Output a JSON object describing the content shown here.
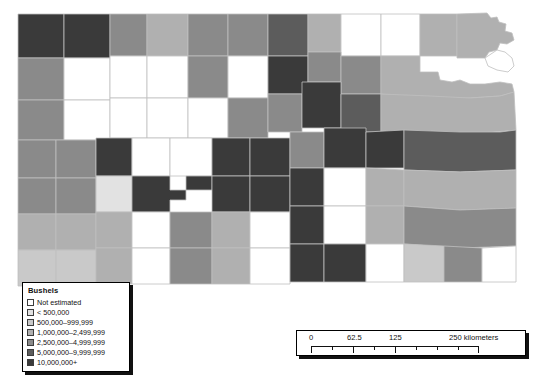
{
  "map": {
    "title": "Kansas county choropleth map",
    "region": "Kansas",
    "background_color": "#ffffff",
    "border_color": "#bfbfbf",
    "classes": [
      {
        "key": "not_estimated",
        "label": "Not estimated",
        "color": "#ffffff"
      },
      {
        "key": "lt500k",
        "label": "< 500,000",
        "color": "#e2e2e2"
      },
      {
        "key": "500k_999k",
        "label": "500,000–999,999",
        "color": "#c9c9c9"
      },
      {
        "key": "1m_2499k",
        "label": "1,000,000–2,499,999",
        "color": "#b0b0b0"
      },
      {
        "key": "2500k_4999k",
        "label": "2,500,000–4,999,999",
        "color": "#8a8a8a"
      },
      {
        "key": "5m_9999k",
        "label": "5,000,000–9,999,999",
        "color": "#5c5c5c"
      },
      {
        "key": "10m_plus",
        "label": "10,000,000+",
        "color": "#3a3a3a"
      }
    ],
    "counties": [
      {
        "name": "cheyenne",
        "class": 6,
        "d": "M18,14 L64,14 L64,58 L18,58 Z"
      },
      {
        "name": "rawlins",
        "class": 6,
        "d": "M64,14 L110,14 L110,58 L64,58 Z"
      },
      {
        "name": "decatur",
        "class": 4,
        "d": "M110,14 L147,14 L147,56 L110,56 Z"
      },
      {
        "name": "norton",
        "class": 3,
        "d": "M147,14 L188,14 L188,56 L147,56 Z"
      },
      {
        "name": "phillips",
        "class": 4,
        "d": "M188,14 L228,14 L228,56 L188,56 Z"
      },
      {
        "name": "smith",
        "class": 4,
        "d": "M228,14 L268,14 L268,56 L228,56 Z"
      },
      {
        "name": "jewell",
        "class": 5,
        "d": "M268,14 L308,14 L308,56 L268,56 Z"
      },
      {
        "name": "republic",
        "class": 3,
        "d": "M308,14 L341,14 L341,52 L308,52 Z"
      },
      {
        "name": "washington",
        "class": 0,
        "d": "M341,14 L381,14 L381,56 L341,56 Z"
      },
      {
        "name": "marshall",
        "class": 0,
        "d": "M381,14 L420,14 L420,56 L381,56 Z"
      },
      {
        "name": "nemaha",
        "class": 3,
        "d": "M420,14 L457,14 L457,56 L420,56 Z"
      },
      {
        "name": "brown",
        "class": 3,
        "d": "M457,14 L487,13 L491,18 L497,17 L499,22 L506,24 L505,31 L512,33 L514,40 L507,44 L500,43 L497,50 L489,52 L485,58 L457,58 Z"
      },
      {
        "name": "sherman",
        "class": 4,
        "d": "M18,58 L64,58 L64,100 L18,100 Z"
      },
      {
        "name": "thomas",
        "class": 0,
        "d": "M64,58 L110,58 L110,100 L64,100 Z"
      },
      {
        "name": "sheridan",
        "class": 0,
        "d": "M110,56 L147,56 L147,98 L110,98 Z"
      },
      {
        "name": "graham",
        "class": 0,
        "d": "M147,56 L188,56 L188,98 L147,98 Z"
      },
      {
        "name": "rooks",
        "class": 4,
        "d": "M188,56 L228,56 L228,98 L188,98 Z"
      },
      {
        "name": "osborne",
        "class": 0,
        "d": "M228,56 L268,56 L268,98 L228,98 Z"
      },
      {
        "name": "mitchell",
        "class": 6,
        "d": "M268,56 L308,56 L308,94 L268,94 Z"
      },
      {
        "name": "cloud",
        "class": 4,
        "d": "M308,52 L341,52 L341,82 L308,82 Z"
      },
      {
        "name": "clay",
        "class": 4,
        "d": "M341,56 L381,56 L381,94 L341,94 Z"
      },
      {
        "name": "riley-pottawatomie",
        "class": 3,
        "d": "M381,56 L420,56 L420,72 L438,72 L440,80 L452,82 L460,80 L470,84 L485,84 L500,82 L512,84 L514,92 L500,96 L470,98 L430,98 L400,96 L381,94 Z"
      },
      {
        "name": "doniphan",
        "class": 0,
        "d": "M485,58 L497,50 L505,52 L512,58 L514,66 L508,72 L497,70 L488,66 Z"
      },
      {
        "name": "wallace",
        "class": 4,
        "d": "M18,100 L64,100 L64,140 L18,140 Z"
      },
      {
        "name": "logan",
        "class": 0,
        "d": "M64,100 L110,100 L110,140 L64,140 Z"
      },
      {
        "name": "gove",
        "class": 0,
        "d": "M110,98 L147,98 L147,138 L110,138 Z"
      },
      {
        "name": "trego",
        "class": 0,
        "d": "M147,98 L188,98 L188,138 L147,138 Z"
      },
      {
        "name": "ellis",
        "class": 0,
        "d": "M188,98 L228,98 L228,138 L188,138 Z"
      },
      {
        "name": "russell",
        "class": 4,
        "d": "M228,98 L268,98 L268,138 L228,138 Z"
      },
      {
        "name": "lincoln",
        "class": 4,
        "d": "M268,94 L302,94 L302,132 L268,132 Z"
      },
      {
        "name": "ottawa",
        "class": 6,
        "d": "M302,82 L341,82 L341,128 L302,128 Z"
      },
      {
        "name": "dickinson",
        "class": 5,
        "d": "M341,94 L381,94 L381,132 L341,132 Z"
      },
      {
        "name": "shawnee-region",
        "class": 3,
        "d": "M381,94 L430,96 L470,98 L500,96 L514,92 L516,130 L470,134 L430,134 L381,132 Z"
      },
      {
        "name": "greeley",
        "class": 4,
        "d": "M18,140 L56,140 L56,178 L18,178 Z"
      },
      {
        "name": "wichita",
        "class": 4,
        "d": "M56,140 L96,140 L96,178 L56,178 Z"
      },
      {
        "name": "scott",
        "class": 6,
        "d": "M96,138 L132,138 L132,176 L96,176 Z"
      },
      {
        "name": "lane",
        "class": 0,
        "d": "M132,138 L170,138 L170,176 L132,176 Z"
      },
      {
        "name": "ness",
        "class": 0,
        "d": "M170,138 L212,138 L212,176 L170,176 Z"
      },
      {
        "name": "rush",
        "class": 6,
        "d": "M212,138 L250,138 L250,176 L212,176 Z"
      },
      {
        "name": "barton",
        "class": 6,
        "d": "M250,138 L290,138 L290,176 L250,176 Z"
      },
      {
        "name": "ellsworth",
        "class": 4,
        "d": "M290,132 L324,132 L324,168 L290,168 Z"
      },
      {
        "name": "saline",
        "class": 6,
        "d": "M324,128 L366,128 L366,168 L324,168 Z"
      },
      {
        "name": "morris",
        "class": 6,
        "d": "M366,132 L404,130 L404,168 L366,168 Z"
      },
      {
        "name": "lyon-osage",
        "class": 5,
        "d": "M404,130 L460,132 L500,132 L516,130 L516,170 L460,172 L404,170 Z"
      },
      {
        "name": "hamilton",
        "class": 4,
        "d": "M18,178 L56,178 L56,214 L18,214 Z"
      },
      {
        "name": "kearny",
        "class": 4,
        "d": "M56,178 L96,178 L96,214 L56,214 Z"
      },
      {
        "name": "finney",
        "class": 1,
        "d": "M96,176 L132,176 L132,212 L96,212 Z"
      },
      {
        "name": "hodgeman",
        "class": 6,
        "d": "M132,176 L170,176 L170,190 L186,190 L186,200 L170,200 L170,212 L132,212 Z"
      },
      {
        "name": "pawnee",
        "class": 6,
        "d": "M186,176 L212,176 L212,190 L186,190 Z"
      },
      {
        "name": "stafford",
        "class": 6,
        "d": "M212,176 L250,176 L250,212 L212,212 Z"
      },
      {
        "name": "reno",
        "class": 6,
        "d": "M250,176 L290,176 L290,212 L250,212 Z"
      },
      {
        "name": "mcpherson",
        "class": 6,
        "d": "M290,168 L324,168 L324,206 L290,206 Z"
      },
      {
        "name": "harvey",
        "class": 0,
        "d": "M324,168 L366,168 L366,206 L324,206 Z"
      },
      {
        "name": "butler",
        "class": 3,
        "d": "M366,168 L404,170 L404,206 L366,206 Z"
      },
      {
        "name": "greenwood-coffey",
        "class": 3,
        "d": "M404,170 L460,172 L516,170 L516,208 L460,210 L404,206 Z"
      },
      {
        "name": "stanton",
        "class": 3,
        "d": "M18,214 L56,214 L56,250 L18,250 Z"
      },
      {
        "name": "grant",
        "class": 3,
        "d": "M56,214 L96,214 L96,250 L56,250 Z"
      },
      {
        "name": "haskell",
        "class": 3,
        "d": "M96,212 L132,212 L132,248 L96,248 Z"
      },
      {
        "name": "gray",
        "class": 0,
        "d": "M132,212 L170,212 L170,248 L132,248 Z"
      },
      {
        "name": "ford",
        "class": 4,
        "d": "M170,212 L212,212 L212,248 L170,248 Z"
      },
      {
        "name": "edwards",
        "class": 3,
        "d": "M212,212 L250,212 L250,248 L212,248 Z"
      },
      {
        "name": "kingman",
        "class": 0,
        "d": "M250,212 L290,212 L290,248 L250,248 Z"
      },
      {
        "name": "sedgwick",
        "class": 6,
        "d": "M290,206 L324,206 L324,244 L290,244 Z"
      },
      {
        "name": "cowley-area",
        "class": 0,
        "d": "M324,206 L366,206 L366,244 L324,244 Z"
      },
      {
        "name": "woodson",
        "class": 3,
        "d": "M366,206 L404,206 L404,244 L366,244 Z"
      },
      {
        "name": "allen-bourbon",
        "class": 4,
        "d": "M404,206 L460,210 L516,208 L516,246 L460,248 L404,244 Z"
      },
      {
        "name": "morton",
        "class": 2,
        "d": "M18,250 L56,250 L56,286 L18,286 Z"
      },
      {
        "name": "stevens",
        "class": 2,
        "d": "M56,250 L96,250 L96,286 L56,286 Z"
      },
      {
        "name": "seward",
        "class": 3,
        "d": "M96,248 L132,248 L132,284 L96,284 Z"
      },
      {
        "name": "meade",
        "class": 0,
        "d": "M132,248 L170,248 L170,284 L132,284 Z"
      },
      {
        "name": "clark",
        "class": 4,
        "d": "M170,248 L212,248 L212,284 L170,284 Z"
      },
      {
        "name": "comanche",
        "class": 3,
        "d": "M212,248 L250,248 L250,284 L212,284 Z"
      },
      {
        "name": "barber",
        "class": 0,
        "d": "M250,248 L290,248 L290,284 L250,284 Z"
      },
      {
        "name": "harper",
        "class": 6,
        "d": "M290,244 L324,244 L324,282 L290,282 Z"
      },
      {
        "name": "sumner",
        "class": 6,
        "d": "M324,244 L366,244 L366,282 L324,282 Z"
      },
      {
        "name": "chautauqua",
        "class": 0,
        "d": "M366,244 L404,244 L404,282 L366,282 Z"
      },
      {
        "name": "montgomery",
        "class": 2,
        "d": "M404,244 L444,246 L444,282 L404,282 Z"
      },
      {
        "name": "labette",
        "class": 4,
        "d": "M444,246 L482,248 L482,282 L444,282 Z"
      },
      {
        "name": "cherokee",
        "class": 0,
        "d": "M482,248 L516,246 L516,282 L482,282 Z"
      }
    ]
  },
  "legend": {
    "title": "Bushels",
    "items": [
      {
        "label": "Not estimated",
        "color": "#ffffff"
      },
      {
        "label": "< 500,000",
        "color": "#e2e2e2"
      },
      {
        "label": "500,000–999,999",
        "color": "#c9c9c9"
      },
      {
        "label": "1,000,000–2,499,999",
        "color": "#b0b0b0"
      },
      {
        "label": "2,500,000–4,999,999",
        "color": "#8a8a8a"
      },
      {
        "label": "5,000,000–9,999,999",
        "color": "#5c5c5c"
      },
      {
        "label": "10,000,000+",
        "color": "#3a3a3a"
      }
    ]
  },
  "scalebar": {
    "labels": [
      {
        "text": "0",
        "left_px": 12
      },
      {
        "text": "62.5",
        "left_px": 50
      },
      {
        "text": "125",
        "left_px": 92
      },
      {
        "text": "250 kilometers",
        "left_px": 152
      }
    ],
    "ticks": [
      {
        "left_px": 0,
        "size": "major"
      },
      {
        "left_px": 21,
        "size": "minor"
      },
      {
        "left_px": 42,
        "size": "major"
      },
      {
        "left_px": 63,
        "size": "minor"
      },
      {
        "left_px": 84,
        "size": "major"
      },
      {
        "left_px": 105,
        "size": "minor"
      },
      {
        "left_px": 126,
        "size": "minor"
      },
      {
        "left_px": 147,
        "size": "minor"
      },
      {
        "left_px": 167,
        "size": "major"
      }
    ],
    "units": "kilometers"
  }
}
